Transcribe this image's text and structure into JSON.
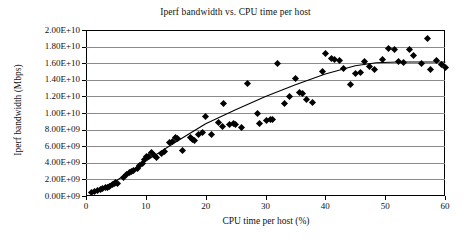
{
  "chart_data": {
    "type": "scatter",
    "title": "Iperf bandwidth vs. CPU time per host",
    "xlabel": "CPU time per host (%)",
    "ylabel": "Iperf bandwidth (Mbps)",
    "xlim": [
      0,
      60
    ],
    "ylim": [
      0,
      20000000000
    ],
    "grid": "horizontal",
    "legend": "none",
    "marker": "black-diamond",
    "xticks": [
      0,
      10,
      20,
      30,
      40,
      50,
      60
    ],
    "xtick_labels": [
      "0",
      "10",
      "20",
      "30",
      "40",
      "50",
      "60"
    ],
    "yticks": [
      0,
      2000000000,
      4000000000,
      6000000000,
      8000000000,
      10000000000,
      12000000000,
      14000000000,
      16000000000,
      18000000000,
      20000000000
    ],
    "ytick_labels": [
      "0.00E+09",
      "2.00E+09",
      "4.00E+09",
      "6.00E+09",
      "8.00E+09",
      "1.00E+10",
      "1.20E+10",
      "1.40E+10",
      "1.60E+10",
      "1.80E+10",
      "2.00E+10"
    ],
    "points": [
      [
        1.0,
        400000000
      ],
      [
        1.4,
        520000000
      ],
      [
        1.9,
        700000000
      ],
      [
        2.4,
        800000000
      ],
      [
        2.8,
        900000000
      ],
      [
        3.2,
        1000000000
      ],
      [
        3.6,
        1050000000
      ],
      [
        4.0,
        1200000000
      ],
      [
        4.4,
        1350000000
      ],
      [
        4.8,
        1450000000
      ],
      [
        5.0,
        1600000000
      ],
      [
        5.2,
        1500000000
      ],
      [
        6.2,
        2250000000
      ],
      [
        6.8,
        2600000000
      ],
      [
        7.2,
        2800000000
      ],
      [
        7.6,
        2950000000
      ],
      [
        8.0,
        3050000000
      ],
      [
        8.6,
        3350000000
      ],
      [
        9.0,
        3700000000
      ],
      [
        9.4,
        3950000000
      ],
      [
        9.8,
        4350000000
      ],
      [
        10.1,
        4700000000
      ],
      [
        10.5,
        4800000000
      ],
      [
        11.0,
        5200000000
      ],
      [
        11.4,
        4850000000
      ],
      [
        11.8,
        4600000000
      ],
      [
        12.6,
        5100000000
      ],
      [
        13.2,
        5350000000
      ],
      [
        14.0,
        6500000000
      ],
      [
        14.4,
        6600000000
      ],
      [
        15.0,
        7050000000
      ],
      [
        15.3,
        6950000000
      ],
      [
        16.1,
        5500000000
      ],
      [
        17.4,
        7000000000
      ],
      [
        17.8,
        6750000000
      ],
      [
        18.2,
        6650000000
      ],
      [
        18.8,
        7350000000
      ],
      [
        19.4,
        7700000000
      ],
      [
        20.0,
        9600000000
      ],
      [
        21.0,
        7350000000
      ],
      [
        22.2,
        8800000000
      ],
      [
        22.8,
        8400000000
      ],
      [
        23.0,
        11150000000
      ],
      [
        24.0,
        8600000000
      ],
      [
        24.6,
        8700000000
      ],
      [
        25.0,
        8650000000
      ],
      [
        26.0,
        8300000000
      ],
      [
        27.0,
        13500000000
      ],
      [
        28.6,
        9950000000
      ],
      [
        29.0,
        8700000000
      ],
      [
        30.2,
        9150000000
      ],
      [
        30.8,
        9250000000
      ],
      [
        31.2,
        9200000000
      ],
      [
        32.0,
        16000000000
      ],
      [
        33.2,
        11100000000
      ],
      [
        34.0,
        12000000000
      ],
      [
        35.0,
        14100000000
      ],
      [
        35.6,
        12500000000
      ],
      [
        36.2,
        12300000000
      ],
      [
        36.8,
        11600000000
      ],
      [
        37.8,
        11250000000
      ],
      [
        39.6,
        15000000000
      ],
      [
        40.0,
        17200000000
      ],
      [
        41.0,
        16600000000
      ],
      [
        41.6,
        16500000000
      ],
      [
        42.4,
        16350000000
      ],
      [
        43.0,
        15400000000
      ],
      [
        44.2,
        13400000000
      ],
      [
        45.0,
        14700000000
      ],
      [
        45.8,
        14900000000
      ],
      [
        46.6,
        16150000000
      ],
      [
        47.4,
        15650000000
      ],
      [
        48.2,
        15200000000
      ],
      [
        49.6,
        16400000000
      ],
      [
        50.6,
        17800000000
      ],
      [
        51.6,
        17600000000
      ],
      [
        52.2,
        16150000000
      ],
      [
        53.0,
        16100000000
      ],
      [
        54.0,
        17600000000
      ],
      [
        54.8,
        16900000000
      ],
      [
        56.0,
        16000000000
      ],
      [
        57.0,
        19000000000
      ],
      [
        57.6,
        15200000000
      ],
      [
        58.6,
        16350000000
      ],
      [
        59.4,
        15900000000
      ],
      [
        60.0,
        15500000000
      ]
    ],
    "trend_line": {
      "style": "solid-black",
      "description": "Rises near-linearly from origin then saturates around 1.6E+10",
      "points": [
        [
          0.8,
          300000000
        ],
        [
          5.0,
          1800000000
        ],
        [
          10.0,
          4200000000
        ],
        [
          15.0,
          6500000000
        ],
        [
          20.0,
          8700000000
        ],
        [
          25.0,
          10400000000
        ],
        [
          30.0,
          12000000000
        ],
        [
          35.0,
          13400000000
        ],
        [
          40.0,
          14700000000
        ],
        [
          45.0,
          15700000000
        ],
        [
          48.5,
          16050000000
        ],
        [
          52.0,
          16150000000
        ],
        [
          56.0,
          16150000000
        ],
        [
          60.0,
          16150000000
        ]
      ]
    }
  }
}
